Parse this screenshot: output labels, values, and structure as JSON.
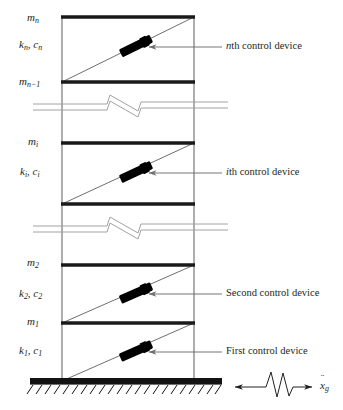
{
  "figure": {
    "type": "engineering-schematic",
    "width": 343,
    "height": 410,
    "background_color": "#ffffff",
    "line_color": "#231f20",
    "device_color": "#000000",
    "leader_color": "#6e6e6e",
    "break_color": "#9a9a9a"
  },
  "story_labels": [
    {
      "id": "mass-n",
      "mass": "m",
      "mass_sub": "n",
      "y": 18
    },
    {
      "id": "stiff-n",
      "k": "k",
      "k_sub": "n",
      "c": "c",
      "c_sub": "n",
      "y": 45
    },
    {
      "id": "mass-n-1",
      "mass": "m",
      "mass_sub": "n−1",
      "y": 84
    },
    {
      "id": "mass-i",
      "mass": "m",
      "mass_sub": "i",
      "y": 142
    },
    {
      "id": "stiff-i",
      "k": "k",
      "k_sub": "i",
      "c": "c",
      "c_sub": "i",
      "y": 172
    },
    {
      "id": "mass-2",
      "mass": "m",
      "mass_sub": "2",
      "y": 262
    },
    {
      "id": "stiff-2",
      "k": "k",
      "k_sub": "2",
      "c": "c",
      "c_sub": "2",
      "y": 294
    },
    {
      "id": "mass-1",
      "mass": "m",
      "mass_sub": "1",
      "y": 323
    },
    {
      "id": "stiff-1",
      "k": "k",
      "k_sub": "1",
      "c": "c",
      "c_sub": "1",
      "y": 351
    }
  ],
  "masses": [
    {
      "symbol": "m",
      "subscript": "n"
    },
    {
      "symbol": "m",
      "subscript": "n−1"
    },
    {
      "symbol": "m",
      "subscript": "i"
    },
    {
      "symbol": "m",
      "subscript": "2"
    },
    {
      "symbol": "m",
      "subscript": "1"
    }
  ],
  "stiffness_damping": [
    {
      "k": "k",
      "c": "c",
      "subscript": "n"
    },
    {
      "k": "k",
      "c": "c",
      "subscript": "i"
    },
    {
      "k": "k",
      "c": "c",
      "subscript": "2"
    },
    {
      "k": "k",
      "c": "c",
      "subscript": "1"
    }
  ],
  "callouts": [
    {
      "id": "callout-n",
      "prefix": "n",
      "prefix_italic": true,
      "text": "th control device",
      "label_x": 224,
      "label_y": 44,
      "leader_from_x": 325,
      "leader_to_x": 139,
      "leader_y": 48
    },
    {
      "id": "callout-i",
      "prefix": "i",
      "prefix_italic": true,
      "text": "th control device",
      "label_x": 224,
      "label_y": 169,
      "leader_from_x": 325,
      "leader_to_x": 139,
      "leader_y": 173
    },
    {
      "id": "callout-second",
      "prefix": "",
      "prefix_italic": false,
      "text": "Second control device",
      "label_x": 224,
      "label_y": 291,
      "leader_from_x": 325,
      "leader_to_x": 139,
      "leader_y": 295
    },
    {
      "id": "callout-first",
      "prefix": "",
      "prefix_italic": false,
      "text": "First control device",
      "label_x": 224,
      "label_y": 348,
      "leader_from_x": 325,
      "leader_to_x": 139,
      "leader_y": 352
    }
  ],
  "ground_excitation": {
    "id": "ground-acceleration",
    "symbol": "x",
    "accent": "¨",
    "subscript": "g",
    "label_x": 322,
    "label_y": 382,
    "arrow_left_x": 234,
    "arrow_right_x": 312,
    "arrow_y": 387,
    "description": "ground acceleration double arrow with seismic zigzag"
  },
  "geometry": {
    "column_left_x": 62,
    "column_right_x": 194,
    "floors": [
      {
        "name": "roof-floor-n",
        "y": 17,
        "thick": 3
      },
      {
        "name": "floor-n-1",
        "y": 82,
        "thick": 3
      },
      {
        "name": "floor-i",
        "y": 143,
        "thick": 3
      },
      {
        "name": "floor-i-1",
        "y": 204,
        "thick": 3
      },
      {
        "name": "floor-2",
        "y": 265,
        "thick": 3
      },
      {
        "name": "floor-1",
        "y": 323,
        "thick": 3
      }
    ],
    "braces": [
      {
        "name": "brace-n",
        "x1": 62,
        "y1": 82,
        "x2": 194,
        "y2": 17,
        "device_t": 0.56
      },
      {
        "name": "brace-i",
        "x1": 62,
        "y1": 204,
        "x2": 194,
        "y2": 143,
        "device_t": 0.56
      },
      {
        "name": "brace-2",
        "x1": 62,
        "y1": 323,
        "x2": 194,
        "y2": 265,
        "device_t": 0.56
      },
      {
        "name": "brace-1",
        "x1": 62,
        "y1": 381,
        "x2": 194,
        "y2": 323,
        "device_t": 0.56
      }
    ],
    "breaks": [
      {
        "name": "break-upper",
        "y": 108
      },
      {
        "name": "break-lower",
        "y": 230
      }
    ],
    "ground": {
      "y": 381,
      "x1": 30,
      "x2": 222,
      "thick": 7,
      "hatch_count": 21
    }
  }
}
